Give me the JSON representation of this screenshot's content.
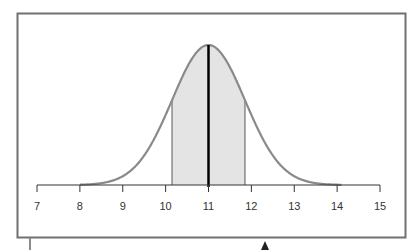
{
  "chart_data": {
    "type": "area",
    "title": "",
    "xlabel": "",
    "ylabel": "",
    "xlim": [
      7,
      15
    ],
    "x_ticks": [
      7,
      8,
      9,
      10,
      11,
      12,
      13,
      14,
      15
    ],
    "tick_labels": [
      "7",
      "8",
      "9",
      "10",
      "11",
      "12",
      "13",
      "14",
      "15"
    ],
    "distribution": "normal",
    "mean": 11,
    "std_dev": 0.85,
    "shaded_region": {
      "from": 10.15,
      "to": 11.85,
      "description": "mean ± 1 standard deviation"
    },
    "mean_line": {
      "x": 11,
      "color": "#000000"
    },
    "grid": false,
    "legend": "none",
    "colors": {
      "curve": "#8a8a8a",
      "shade": "#e4e4e4",
      "frame": "#707070",
      "axis": "#333333",
      "mean_line": "#000000"
    }
  },
  "annotations": {
    "pointer": "upward arrow below frame"
  }
}
